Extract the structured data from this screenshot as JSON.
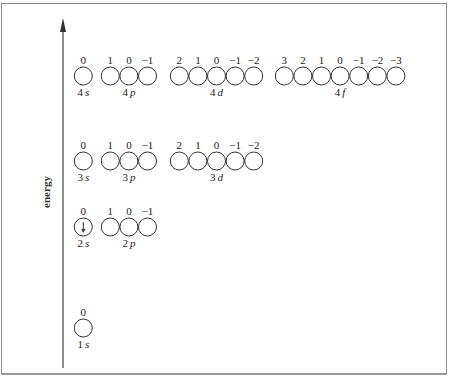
{
  "axis": {
    "label": "energy"
  },
  "shells": [
    {
      "n": "4",
      "subshells": [
        {
          "label_n": "4",
          "label_l": "s",
          "ml": [
            "0"
          ],
          "electrons": []
        },
        {
          "label_n": "4",
          "label_l": "p",
          "ml": [
            "1",
            "0",
            "−1"
          ],
          "electrons": []
        },
        {
          "label_n": "4",
          "label_l": "d",
          "ml": [
            "2",
            "1",
            "0",
            "−1",
            "−2"
          ],
          "electrons": []
        },
        {
          "label_n": "4",
          "label_l": "f",
          "ml": [
            "3",
            "2",
            "1",
            "0",
            "−1",
            "−2",
            "−3"
          ],
          "electrons": []
        }
      ]
    },
    {
      "n": "3",
      "subshells": [
        {
          "label_n": "3",
          "label_l": "s",
          "ml": [
            "0"
          ],
          "electrons": []
        },
        {
          "label_n": "3",
          "label_l": "p",
          "ml": [
            "1",
            "0",
            "−1"
          ],
          "electrons": []
        },
        {
          "label_n": "3",
          "label_l": "d",
          "ml": [
            "2",
            "1",
            "0",
            "−1",
            "−2"
          ],
          "electrons": []
        }
      ]
    },
    {
      "n": "2",
      "subshells": [
        {
          "label_n": "2",
          "label_l": "s",
          "ml": [
            "0"
          ],
          "electrons": [
            "down"
          ]
        },
        {
          "label_n": "2",
          "label_l": "p",
          "ml": [
            "1",
            "0",
            "−1"
          ],
          "electrons": []
        }
      ]
    },
    {
      "n": "1",
      "subshells": [
        {
          "label_n": "1",
          "label_l": "s",
          "ml": [
            "0"
          ],
          "electrons": []
        }
      ]
    }
  ]
}
